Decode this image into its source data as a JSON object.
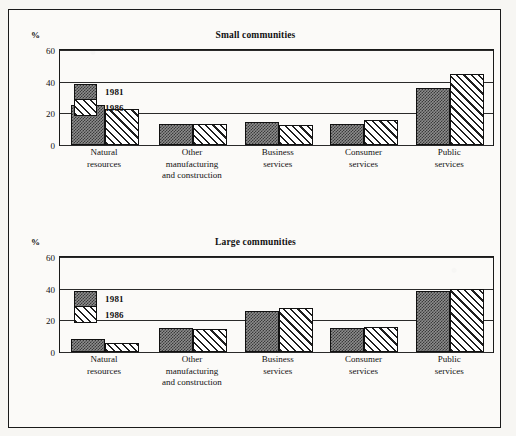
{
  "chart_data": [
    {
      "type": "bar",
      "title": "Small communities",
      "ylabel": "%",
      "xlabel": "",
      "ylim": [
        0,
        60
      ],
      "yticks": [
        0,
        20,
        40,
        60
      ],
      "grid": true,
      "legend_position": "inside-left",
      "categories": [
        [
          "Natural",
          "resources"
        ],
        [
          "Other",
          "manufacturing",
          "and construction"
        ],
        [
          "Business",
          "services"
        ],
        [
          "Consumer",
          "services"
        ],
        [
          "Public",
          "services"
        ]
      ],
      "series": [
        {
          "name": "1981",
          "fill": "stipple",
          "values": [
            25.5,
            13.0,
            14.5,
            13.5,
            36.0
          ]
        },
        {
          "name": "1986",
          "fill": "hatch",
          "values": [
            22.5,
            13.0,
            12.5,
            15.5,
            45.0
          ]
        }
      ]
    },
    {
      "type": "bar",
      "title": "Large communities",
      "ylabel": "%",
      "xlabel": "",
      "ylim": [
        0,
        60
      ],
      "yticks": [
        0,
        20,
        40,
        60
      ],
      "grid": true,
      "legend_position": "inside-left",
      "categories": [
        [
          "Natural",
          "resources"
        ],
        [
          "Other",
          "manufacturing",
          "and construction"
        ],
        [
          "Business",
          "services"
        ],
        [
          "Consumer",
          "services"
        ],
        [
          "Public",
          "services"
        ]
      ],
      "series": [
        {
          "name": "1981",
          "fill": "stipple",
          "values": [
            8.0,
            15.0,
            26.0,
            15.0,
            38.5
          ]
        },
        {
          "name": "1986",
          "fill": "hatch",
          "values": [
            6.0,
            14.5,
            27.5,
            15.5,
            40.0
          ]
        }
      ]
    }
  ],
  "colors": {
    "ink": "#111111",
    "paper": "#f7f6f3",
    "series_1981": "#8d8d8d",
    "series_1986": "#ffffff"
  }
}
